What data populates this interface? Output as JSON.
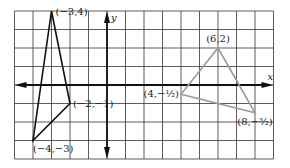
{
  "diagram": {
    "type": "coordinate-plane",
    "grid": {
      "x_min": -5,
      "x_max": 9,
      "y_min": -4,
      "y_max": 4,
      "origin_px": [
        107,
        85
      ],
      "unit_px": 18.5
    },
    "axes": {
      "x_label": "x",
      "y_label": "y"
    },
    "colors": {
      "grid": "#333333",
      "axes": "#111111",
      "triangle_a": "#111111",
      "triangle_b": "#9a9a9a"
    },
    "triangles": [
      {
        "name": "triangle-a",
        "vertices": [
          {
            "x": -3,
            "y": 4,
            "label": "(−3,4)"
          },
          {
            "x": -2,
            "y": -1,
            "label": "(−2,−1)"
          },
          {
            "x": -4,
            "y": -3,
            "label": "(−4,−3)"
          }
        ]
      },
      {
        "name": "triangle-b",
        "vertices": [
          {
            "x": 6,
            "y": 2,
            "label": "(6,2)"
          },
          {
            "x": 8,
            "y": -1.5,
            "label": "(8,−³⁄₂)"
          },
          {
            "x": 4,
            "y": -0.5,
            "label": "(4,−¹⁄₂)"
          }
        ]
      }
    ]
  }
}
